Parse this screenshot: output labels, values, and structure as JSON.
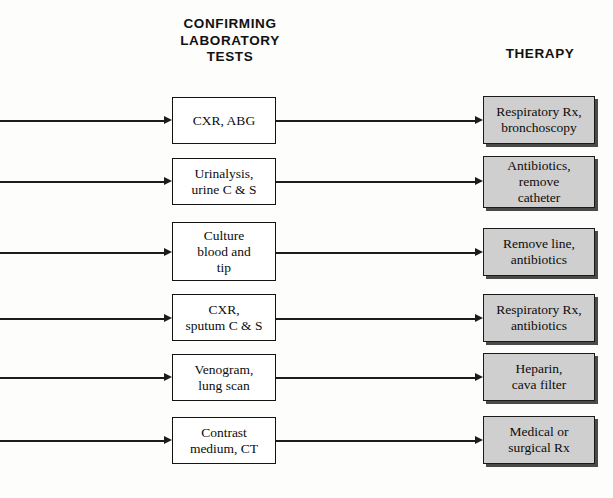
{
  "headers": {
    "tests": "CONFIRMING\nLABORATORY\nTESTS",
    "therapy": "THERAPY"
  },
  "colors": {
    "therapy_fill": "#cfcfcf",
    "box_border": "#1a1a1a",
    "shadow": "#4a4a4a",
    "line": "#1c1c1c",
    "text": "#0c0c0c",
    "page_background": "#fdfdfc"
  },
  "rows": [
    {
      "test": "CXR, ABG",
      "therapy": "Respiratory Rx,\nbronchoscopy"
    },
    {
      "test": "Urinalysis,\nurine C & S",
      "therapy": "Antibiotics,\nremove\ncatheter"
    },
    {
      "test": "Culture\nblood and\ntip",
      "therapy": "Remove line,\nantibiotics"
    },
    {
      "test": "CXR,\nsputum C & S",
      "therapy": "Respiratory Rx,\nantibiotics"
    },
    {
      "test": "Venogram,\nlung scan",
      "therapy": "Heparin,\ncava filter"
    },
    {
      "test": "Contrast\nmedium, CT",
      "therapy": "Medical or\nsurgical Rx"
    }
  ]
}
